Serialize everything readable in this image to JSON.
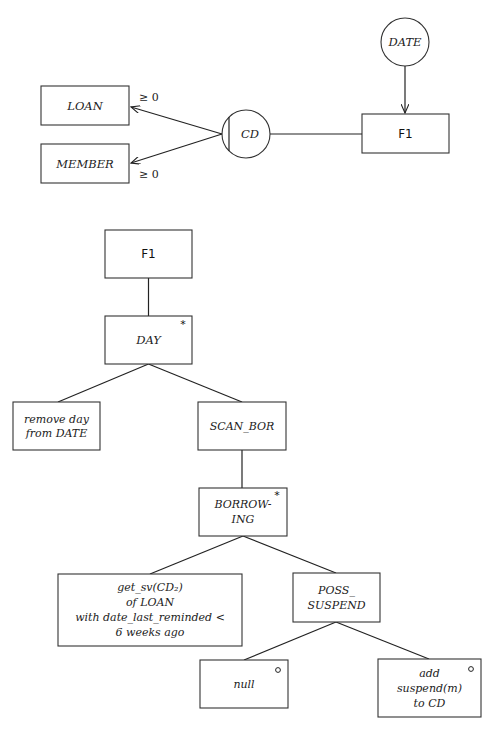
{
  "context_diagram": {
    "process_label": "F1",
    "data_stores": [
      {
        "id": "date",
        "label": "DATE"
      },
      {
        "id": "cd",
        "label": "CD"
      }
    ],
    "entities": [
      {
        "id": "loan",
        "label": "LOAN",
        "cardinality": "≥ 0"
      },
      {
        "id": "member",
        "label": "MEMBER",
        "cardinality": "≥ 0"
      }
    ]
  },
  "structure_diagram": {
    "root": {
      "label": "F1"
    },
    "day": {
      "label": "DAY",
      "marker": "*"
    },
    "remove_day": {
      "lines": [
        "remove day",
        "from DATE"
      ]
    },
    "scan_bor": {
      "label": "SCAN_BOR"
    },
    "borrowing": {
      "lines": [
        "BORROW-",
        "ING"
      ],
      "marker": "*"
    },
    "get_sv": {
      "lines": [
        "get_sv(CD₂)",
        "of LOAN",
        "with date_last_reminded <",
        "6 weeks ago"
      ]
    },
    "poss_suspend": {
      "lines": [
        "POSS_",
        "SUSPEND"
      ]
    },
    "null_node": {
      "label": "null",
      "marker": "o"
    },
    "add_suspend": {
      "lines": [
        "add",
        "suspend(m)",
        "to CD"
      ],
      "marker": "o"
    }
  }
}
